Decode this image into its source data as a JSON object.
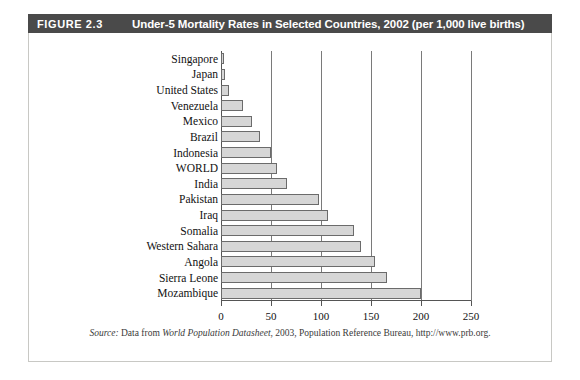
{
  "figure": {
    "tag": "FIGURE 2.3",
    "title": "Under-5 Mortality Rates in Selected Countries, 2002 (per 1,000 live births)",
    "source_prefix": "Source:",
    "source_text_1": " Data from ",
    "source_italic": "World Population Datasheet",
    "source_text_2": ", 2003, Population Reference Bureau, http://www.prb.org.",
    "header_color": "#4a4a4a",
    "bar_fill": "#d6d6d6",
    "bar_stroke": "#6b6b6b"
  },
  "chart_data": {
    "type": "bar",
    "orientation": "horizontal",
    "title": "Under-5 Mortality Rates in Selected Countries, 2002 (per 1,000 live births)",
    "xlabel": "",
    "ylabel": "",
    "xlim": [
      0,
      250
    ],
    "grid": true,
    "legend": false,
    "unit": "deaths per 1,000 live births",
    "xticks": [
      0,
      50,
      100,
      150,
      200,
      250
    ],
    "categories": [
      "Singapore",
      "Japan",
      "United States",
      "Venezuela",
      "Mexico",
      "Brazil",
      "Indonesia",
      "WORLD",
      "India",
      "Pakistan",
      "Iraq",
      "Somalia",
      "Western Sahara",
      "Angola",
      "Sierra Leone",
      "Mozambique"
    ],
    "values": [
      3,
      4,
      8,
      22,
      31,
      39,
      50,
      56,
      66,
      98,
      107,
      133,
      140,
      154,
      166,
      200
    ]
  }
}
